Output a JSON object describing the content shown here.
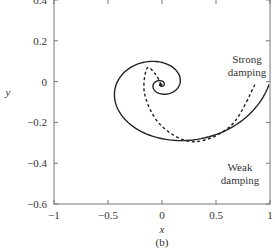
{
  "chart_data": {
    "type": "line",
    "title": "",
    "caption": "(b)",
    "xlabel": "x",
    "ylabel": "y",
    "xlim": [
      -1,
      1
    ],
    "ylim": [
      -0.6,
      0.4
    ],
    "xticks": [
      -1,
      -0.5,
      0,
      0.5,
      1
    ],
    "xtick_labels": [
      "−1",
      "−0.5",
      "0",
      "0.5",
      "1"
    ],
    "yticks": [
      0.4,
      0.2,
      0,
      -0.2,
      -0.4,
      -0.6
    ],
    "ytick_labels": [
      "0.4",
      "0.2",
      "0",
      "−0.2",
      "−0.4",
      "−0.6"
    ],
    "grid": false,
    "legend": "none",
    "series": [
      {
        "name": "Weak damping",
        "style": "solid",
        "color": "#222222",
        "description": "Slowly decaying spiral starting at (1, 0) and spiraling clockwise into the origin",
        "start": [
          1.0,
          0.0
        ],
        "points": [
          [
            1.0,
            0.0
          ],
          [
            0.0,
            -0.41
          ],
          [
            -0.74,
            0.0
          ],
          [
            0.0,
            0.3
          ],
          [
            0.52,
            0.0
          ],
          [
            0.0,
            -0.22
          ],
          [
            -0.38,
            0.0
          ],
          [
            0.0,
            0.16
          ],
          [
            0.27,
            0.0
          ],
          [
            0.0,
            -0.11
          ],
          [
            -0.18,
            0.0
          ],
          [
            0.0,
            0.07
          ],
          [
            0.11,
            0.0
          ],
          [
            0.0,
            -0.045
          ],
          [
            0,
            0
          ]
        ]
      },
      {
        "name": "Strong damping",
        "style": "dashed",
        "color": "#222222",
        "description": "Rapidly decaying trajectory starting near (0.87, 0) and curving into the origin",
        "start": [
          0.87,
          0.0
        ],
        "points": [
          [
            0.87,
            0.0
          ],
          [
            0.65,
            -0.2
          ],
          [
            0.3,
            -0.28
          ],
          [
            0.0,
            -0.2
          ],
          [
            -0.15,
            -0.05
          ],
          [
            -0.13,
            0.08
          ],
          [
            -0.05,
            0.05
          ],
          [
            0,
            0
          ]
        ]
      }
    ],
    "annotations": [
      {
        "text": "Strong damping",
        "lines": [
          "Strong",
          "damping"
        ],
        "near": [
          0.7,
          0.08
        ]
      },
      {
        "text": "Weak damping",
        "lines": [
          "Weak",
          "damping"
        ],
        "near": [
          0.66,
          -0.45
        ]
      }
    ]
  }
}
